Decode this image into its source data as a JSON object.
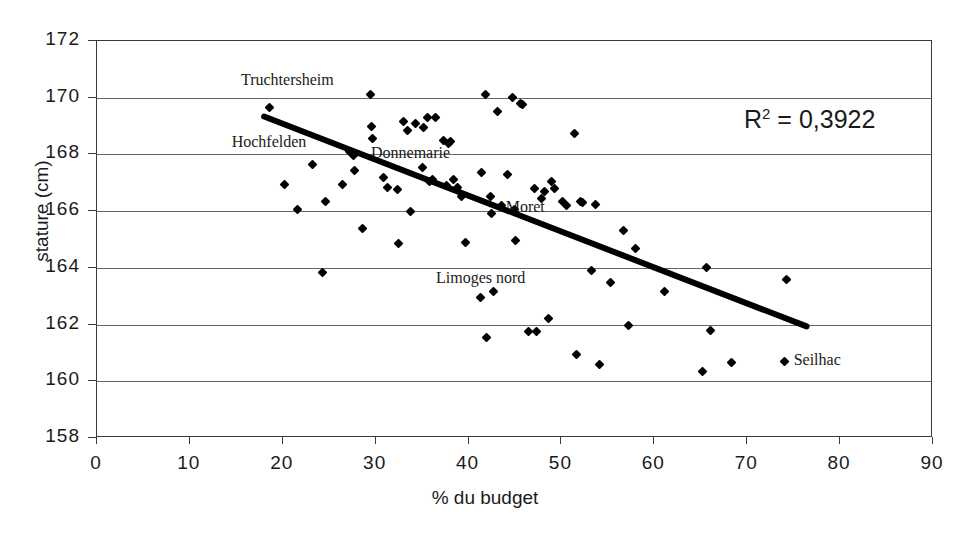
{
  "chart_data": {
    "type": "scatter",
    "title": "",
    "xlabel": "% du budget",
    "ylabel": "stature (cm)",
    "xlim": [
      0,
      90
    ],
    "ylim": [
      158,
      172
    ],
    "xticks": [
      0,
      10,
      20,
      30,
      40,
      50,
      60,
      70,
      80,
      90
    ],
    "yticks": [
      158,
      160,
      162,
      164,
      166,
      168,
      170,
      172
    ],
    "grid": "horizontal",
    "legend": "none",
    "annotations": [
      {
        "text": "Truchtersheim",
        "x": 15.5,
        "y": 170.6
      },
      {
        "text": "Hochfelden",
        "x": 14.5,
        "y": 168.4
      },
      {
        "text": "Donnemarie",
        "x": 29.5,
        "y": 168.0
      },
      {
        "text": "Moret",
        "x": 44.0,
        "y": 166.1
      },
      {
        "text": "Limoges nord",
        "x": 36.5,
        "y": 163.6
      },
      {
        "text": "Seilhac",
        "x": 75.0,
        "y": 160.7
      },
      {
        "text": "R² = 0,3922",
        "x": 70.0,
        "y": 168.9
      }
    ],
    "r_squared": "0,3922",
    "r_squared_label": "R",
    "r_squared_exponent": "2",
    "r_squared_equals": "=",
    "trendline": {
      "x0": 18.1,
      "y0": 169.3,
      "x1": 76.5,
      "y1": 161.9,
      "slope": -0.1267,
      "intercept": 171.59
    },
    "points": [
      {
        "x": 18.6,
        "y": 169.65
      },
      {
        "x": 20.2,
        "y": 166.95
      },
      {
        "x": 21.6,
        "y": 166.05
      },
      {
        "x": 23.2,
        "y": 167.65
      },
      {
        "x": 24.3,
        "y": 163.85
      },
      {
        "x": 24.6,
        "y": 166.35
      },
      {
        "x": 26.4,
        "y": 166.95
      },
      {
        "x": 27.2,
        "y": 168.1
      },
      {
        "x": 27.6,
        "y": 167.95
      },
      {
        "x": 27.7,
        "y": 167.45
      },
      {
        "x": 28.6,
        "y": 165.4
      },
      {
        "x": 29.4,
        "y": 170.1
      },
      {
        "x": 29.6,
        "y": 169.0
      },
      {
        "x": 29.7,
        "y": 168.55
      },
      {
        "x": 30.8,
        "y": 167.2
      },
      {
        "x": 31.3,
        "y": 166.85
      },
      {
        "x": 32.4,
        "y": 166.75
      },
      {
        "x": 32.5,
        "y": 164.85
      },
      {
        "x": 33.0,
        "y": 169.15
      },
      {
        "x": 33.4,
        "y": 168.85
      },
      {
        "x": 33.8,
        "y": 166.0
      },
      {
        "x": 34.3,
        "y": 169.1
      },
      {
        "x": 35.0,
        "y": 167.55
      },
      {
        "x": 35.1,
        "y": 168.95
      },
      {
        "x": 35.6,
        "y": 169.3
      },
      {
        "x": 35.8,
        "y": 167.05
      },
      {
        "x": 36.1,
        "y": 167.1
      },
      {
        "x": 36.4,
        "y": 169.3
      },
      {
        "x": 37.3,
        "y": 168.5
      },
      {
        "x": 37.6,
        "y": 166.9
      },
      {
        "x": 37.8,
        "y": 168.4
      },
      {
        "x": 38.1,
        "y": 168.45
      },
      {
        "x": 38.4,
        "y": 167.1
      },
      {
        "x": 38.8,
        "y": 166.85
      },
      {
        "x": 39.2,
        "y": 166.5
      },
      {
        "x": 39.7,
        "y": 164.9
      },
      {
        "x": 41.3,
        "y": 162.95
      },
      {
        "x": 41.4,
        "y": 167.35
      },
      {
        "x": 41.8,
        "y": 170.1
      },
      {
        "x": 41.9,
        "y": 161.55
      },
      {
        "x": 42.4,
        "y": 166.5
      },
      {
        "x": 42.5,
        "y": 165.9
      },
      {
        "x": 42.7,
        "y": 163.15
      },
      {
        "x": 43.1,
        "y": 169.5
      },
      {
        "x": 43.6,
        "y": 166.2
      },
      {
        "x": 44.2,
        "y": 167.3
      },
      {
        "x": 44.7,
        "y": 170.0
      },
      {
        "x": 44.9,
        "y": 166.05
      },
      {
        "x": 45.1,
        "y": 164.95
      },
      {
        "x": 45.6,
        "y": 169.8
      },
      {
        "x": 45.8,
        "y": 169.75
      },
      {
        "x": 46.4,
        "y": 161.75
      },
      {
        "x": 47.1,
        "y": 166.8
      },
      {
        "x": 47.3,
        "y": 161.75
      },
      {
        "x": 47.8,
        "y": 166.45
      },
      {
        "x": 48.2,
        "y": 166.7
      },
      {
        "x": 48.6,
        "y": 162.2
      },
      {
        "x": 48.9,
        "y": 167.05
      },
      {
        "x": 49.3,
        "y": 166.8
      },
      {
        "x": 50.1,
        "y": 166.35
      },
      {
        "x": 50.5,
        "y": 166.2
      },
      {
        "x": 51.4,
        "y": 168.75
      },
      {
        "x": 51.6,
        "y": 160.95
      },
      {
        "x": 52.0,
        "y": 166.35
      },
      {
        "x": 52.3,
        "y": 166.3
      },
      {
        "x": 53.2,
        "y": 163.9
      },
      {
        "x": 53.7,
        "y": 166.25
      },
      {
        "x": 54.1,
        "y": 160.6
      },
      {
        "x": 55.3,
        "y": 163.5
      },
      {
        "x": 56.7,
        "y": 165.3
      },
      {
        "x": 57.2,
        "y": 161.95
      },
      {
        "x": 58.0,
        "y": 164.7
      },
      {
        "x": 61.1,
        "y": 163.15
      },
      {
        "x": 65.2,
        "y": 160.35
      },
      {
        "x": 65.6,
        "y": 164.0
      },
      {
        "x": 66.0,
        "y": 161.8
      },
      {
        "x": 68.3,
        "y": 160.65
      },
      {
        "x": 74.2,
        "y": 163.6
      }
    ]
  },
  "axis": {
    "x_tick_labels": [
      "0",
      "10",
      "20",
      "30",
      "40",
      "50",
      "60",
      "70",
      "80",
      "90"
    ],
    "y_tick_labels": [
      "158",
      "160",
      "162",
      "164",
      "166",
      "168",
      "170",
      "172"
    ],
    "x_title": "% du budget",
    "y_title": "stature (cm)"
  },
  "colors": {
    "marker": "#000000",
    "trendline": "#000000",
    "grid": "#666666",
    "frame": "#3a3a3a",
    "text": "#1a1a1a",
    "background": "#ffffff"
  }
}
